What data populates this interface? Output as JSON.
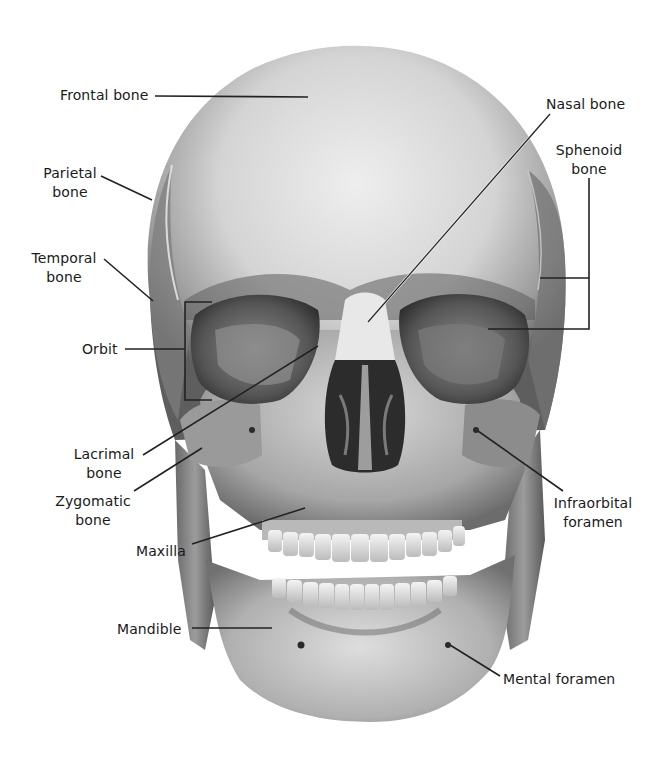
{
  "diagram": {
    "colors": {
      "background": "#ffffff",
      "text": "#1a1a1a",
      "leader_dark": "#222222",
      "leader_light": "#f2f2f2",
      "bone_light": "#e4e4e4",
      "bone_mid": "#a8a8a8",
      "bone_dark": "#3a3a3a"
    },
    "labels": [
      {
        "id": "frontal",
        "lines": [
          "Frontal bone"
        ],
        "x": 60,
        "y": 86,
        "align": "left",
        "leader": [
          [
            155,
            96
          ],
          [
            308,
            97
          ]
        ]
      },
      {
        "id": "parietal",
        "lines": [
          "Parietal",
          "bone"
        ],
        "x": 38,
        "y": 164,
        "align": "center",
        "leader": [
          [
            101,
            176
          ],
          [
            152,
            200
          ]
        ]
      },
      {
        "id": "temporal",
        "lines": [
          "Temporal",
          "bone"
        ],
        "x": 31,
        "y": 249,
        "align": "center",
        "leader": [
          [
            104,
            259
          ],
          [
            153,
            301
          ]
        ]
      },
      {
        "id": "orbit",
        "lines": [
          "Orbit"
        ],
        "x": 82,
        "y": 343,
        "align": "left",
        "leader": [
          [
            125,
            349
          ],
          [
            185,
            349
          ]
        ],
        "bracket": [
          [
            212,
            302
          ],
          [
            185,
            302
          ],
          [
            185,
            400
          ],
          [
            212,
            400
          ]
        ]
      },
      {
        "id": "lacrimal",
        "lines": [
          "Lacrimal",
          "bone"
        ],
        "x": 72,
        "y": 450,
        "align": "center",
        "leader": [
          [
            143,
            455
          ],
          [
            318,
            346
          ]
        ]
      },
      {
        "id": "zygomatic",
        "lines": [
          "Zygomatic",
          "bone"
        ],
        "x": 57,
        "y": 494,
        "align": "center",
        "leader": [
          [
            134,
            491
          ],
          [
            202,
            448
          ]
        ]
      },
      {
        "id": "maxilla",
        "lines": [
          "Maxilla"
        ],
        "x": 137,
        "y": 540,
        "align": "left",
        "leader": [
          [
            192,
            544
          ],
          [
            305,
            508
          ]
        ]
      },
      {
        "id": "mandible",
        "lines": [
          "Mandible"
        ],
        "x": 117,
        "y": 620,
        "align": "left",
        "leader": [
          [
            192,
            628
          ],
          [
            272,
            628
          ]
        ]
      },
      {
        "id": "nasal",
        "lines": [
          "Nasal bone"
        ],
        "x": 547,
        "y": 97,
        "align": "left",
        "leader": [
          [
            550,
            114
          ],
          [
            368,
            322
          ]
        ]
      },
      {
        "id": "sphenoid",
        "lines": [
          "Sphenoid",
          "bone"
        ],
        "x": 556,
        "y": 144,
        "align": "center",
        "leader": [
          [
            589,
            178
          ],
          [
            589,
            329
          ]
        ],
        "bracket": [
          [
            540,
            278
          ],
          [
            589,
            278
          ],
          [
            589,
            329
          ],
          [
            488,
            329
          ]
        ]
      },
      {
        "id": "infraorbital",
        "lines": [
          "Infraorbital",
          "foramen"
        ],
        "x": 552,
        "y": 494,
        "align": "center",
        "leader": [
          [
            478,
            431
          ],
          [
            563,
            491
          ]
        ]
      },
      {
        "id": "mental",
        "lines": [
          "Mental foramen"
        ],
        "x": 503,
        "y": 668,
        "align": "left",
        "leader": [
          [
            450,
            645
          ],
          [
            500,
            676
          ]
        ]
      }
    ]
  }
}
